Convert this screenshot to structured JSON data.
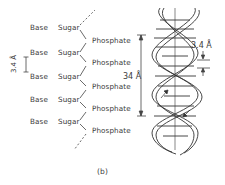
{
  "figure": {
    "caption": "(b)",
    "chain": {
      "rows": [
        {
          "base": "Base",
          "sugar": "Sugar",
          "phosphate": "Phosphate"
        },
        {
          "base": "Base",
          "sugar": "Sugar",
          "phosphate": "Phosphate"
        },
        {
          "base": "Base",
          "sugar": "Sugar",
          "phosphate": "Phosphate"
        },
        {
          "base": "Base",
          "sugar": "Sugar",
          "phosphate": "Phosphate"
        },
        {
          "base": "Base",
          "sugar": "Sugar",
          "phosphate": "Phosphate"
        }
      ],
      "base_spacing_label": "3.4 Å"
    },
    "helix": {
      "pitch_label": "34 Å",
      "rise_label": "3.4 Å"
    }
  }
}
